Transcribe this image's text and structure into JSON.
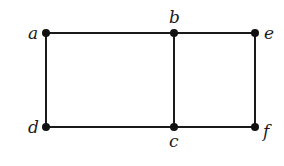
{
  "diagram": {
    "type": "graph",
    "colors": {
      "stroke": "#1a1a1a",
      "node": "#111111",
      "background": "#ffffff"
    },
    "nodes": [
      {
        "id": "a",
        "label": "a",
        "x": 46,
        "y": 33,
        "lx": 28,
        "ly": 39
      },
      {
        "id": "b",
        "label": "b",
        "x": 174,
        "y": 33,
        "lx": 169,
        "ly": 23
      },
      {
        "id": "e",
        "label": "e",
        "x": 255,
        "y": 33,
        "lx": 264,
        "ly": 39
      },
      {
        "id": "d",
        "label": "d",
        "x": 46,
        "y": 127,
        "lx": 28,
        "ly": 133
      },
      {
        "id": "c",
        "label": "c",
        "x": 174,
        "y": 127,
        "lx": 169,
        "ly": 147
      },
      {
        "id": "f",
        "label": "f",
        "x": 255,
        "y": 127,
        "lx": 263,
        "ly": 137
      }
    ],
    "edges": [
      [
        "a",
        "b"
      ],
      [
        "b",
        "e"
      ],
      [
        "a",
        "d"
      ],
      [
        "b",
        "c"
      ],
      [
        "e",
        "f"
      ],
      [
        "d",
        "c"
      ],
      [
        "c",
        "f"
      ]
    ]
  }
}
